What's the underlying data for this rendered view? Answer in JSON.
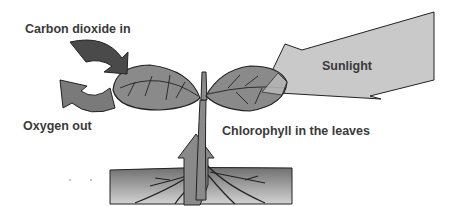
{
  "diagram": {
    "labels": {
      "carbon_dioxide": "Carbon dioxide in",
      "oxygen": "Oxygen out",
      "sunlight": "Sunlight",
      "chlorophyll": "Chlorophyll in the leaves"
    },
    "colors": {
      "co2_arrow": "#4a4a4a",
      "o2_arrow": "#7a7a7a",
      "leaf": "#8a8a8a",
      "sunlight_arrow": "#c8c8c8",
      "soil_top": "#6f6f6f",
      "soil_bottom": "#cfcfcf",
      "text": "#3a3a3a"
    }
  }
}
